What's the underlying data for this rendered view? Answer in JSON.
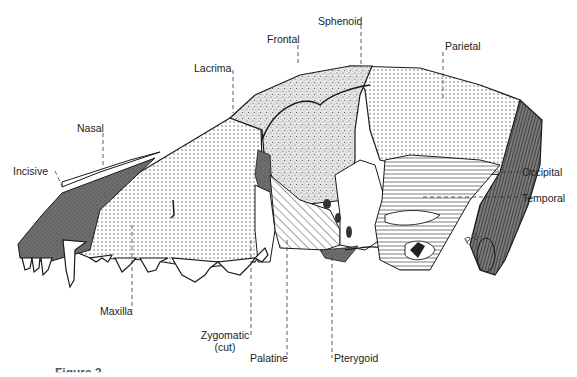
{
  "diagram": {
    "labels": {
      "incisive": "Incisive",
      "nasal": "Nasal",
      "lacrimal": "Lacrima",
      "frontal": "Frontal",
      "sphenoid": "Sphenoid",
      "parietal": "Parietal",
      "occipital": "Occipital",
      "temporal": "Temporal",
      "maxilla": "Maxilla",
      "zygomatic_line1": "Zygomatic",
      "zygomatic_line2": "(cut)",
      "palatine": "Palatine",
      "pterygoid": "Pterygoid"
    },
    "signature": "P.B.",
    "caption": "Figure 3-..."
  },
  "colors": {
    "ink": "#1a1a1a",
    "dark_fill": "#6e6e6e",
    "stipple": "#888888",
    "background": "#ffffff"
  }
}
